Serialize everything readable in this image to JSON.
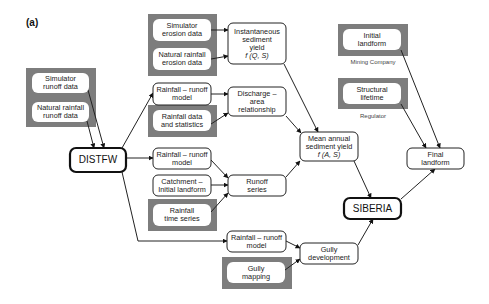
{
  "panel_label": "(a)",
  "nodes": {
    "sim_runoff": {
      "lines": [
        "Simulator",
        "runoff data"
      ],
      "style": "input"
    },
    "nat_runoff": {
      "lines": [
        "Natural rainfall",
        "runoff data"
      ],
      "style": "input"
    },
    "distfw": {
      "lines": [
        "DISTFW"
      ],
      "style": "model"
    },
    "sim_erosion": {
      "lines": [
        "Simulator",
        "erosion data"
      ],
      "style": "input"
    },
    "nat_erosion": {
      "lines": [
        "Natural rainfall",
        "erosion data"
      ],
      "style": "input"
    },
    "inst_yield": {
      "lines": [
        "Instantaneous",
        "sediment",
        "yield",
        "f (Q, S)"
      ],
      "style": "process"
    },
    "rr_model_top": {
      "lines": [
        "Rainfall – runoff",
        "model"
      ],
      "style": "process"
    },
    "discharge_area": {
      "lines": [
        "Discharge –",
        "area",
        "relationship"
      ],
      "style": "process"
    },
    "rain_stats": {
      "lines": [
        "Rainfall data",
        "and statistics"
      ],
      "style": "input"
    },
    "rr_model_mid": {
      "lines": [
        "Rainfall – runoff",
        "model"
      ],
      "style": "process"
    },
    "catchment": {
      "lines": [
        "Catchment –",
        "Initial landform"
      ],
      "style": "process"
    },
    "runoff_series": {
      "lines": [
        "Runoff",
        "series"
      ],
      "style": "process"
    },
    "rain_time": {
      "lines": [
        "Rainfall",
        "time series"
      ],
      "style": "input"
    },
    "mean_yield": {
      "lines": [
        "Mean annual",
        "sediment yield",
        "f (A, S)"
      ],
      "style": "process"
    },
    "rr_model_bot": {
      "lines": [
        "Rainfall – runoff",
        "model"
      ],
      "style": "process"
    },
    "gully_mapping": {
      "lines": [
        "Gully",
        "mapping"
      ],
      "style": "input"
    },
    "gully_dev": {
      "lines": [
        "Gully",
        "development"
      ],
      "style": "process"
    },
    "siberia": {
      "lines": [
        "SIBERIA"
      ],
      "style": "model"
    },
    "initial_landform": {
      "lines": [
        "Initial",
        "landform"
      ],
      "style": "input"
    },
    "structural_lifetime": {
      "lines": [
        "Structural",
        "lifetime"
      ],
      "style": "input"
    },
    "final_landform": {
      "lines": [
        "Final",
        "landform"
      ],
      "style": "process"
    }
  },
  "captions": {
    "mining_company": "Mining Company",
    "regulator": "Regulator"
  },
  "edges": [
    [
      "sim_runoff",
      "distfw"
    ],
    [
      "nat_runoff",
      "distfw"
    ],
    [
      "distfw",
      "rr_model_top"
    ],
    [
      "distfw",
      "rr_model_mid"
    ],
    [
      "distfw",
      "rr_model_bot"
    ],
    [
      "sim_erosion",
      "inst_yield"
    ],
    [
      "nat_erosion",
      "inst_yield"
    ],
    [
      "rr_model_top",
      "discharge_area"
    ],
    [
      "rain_stats",
      "discharge_area"
    ],
    [
      "rr_model_mid",
      "runoff_series"
    ],
    [
      "catchment",
      "runoff_series"
    ],
    [
      "rain_time",
      "runoff_series"
    ],
    [
      "inst_yield",
      "mean_yield"
    ],
    [
      "discharge_area",
      "mean_yield"
    ],
    [
      "runoff_series",
      "mean_yield"
    ],
    [
      "rr_model_bot",
      "gully_dev"
    ],
    [
      "gully_mapping",
      "gully_dev"
    ],
    [
      "mean_yield",
      "siberia"
    ],
    [
      "gully_dev",
      "siberia"
    ],
    [
      "siberia",
      "final_landform"
    ],
    [
      "initial_landform",
      "final_landform"
    ],
    [
      "structural_lifetime",
      "final_landform"
    ]
  ]
}
